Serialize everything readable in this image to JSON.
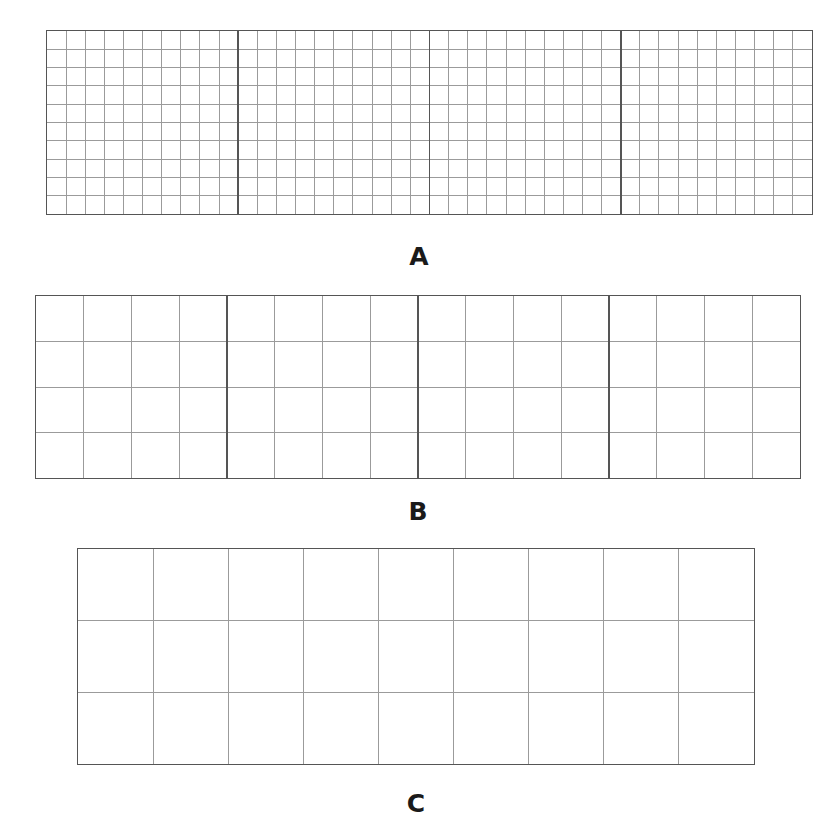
{
  "figure": {
    "panels": [
      {
        "label": "A",
        "blocks": 4,
        "cols_per_block": 10,
        "rows": 10,
        "description": "4 large squares each subdivided into a 10x10 grid"
      },
      {
        "label": "B",
        "blocks": 4,
        "cols_per_block": 4,
        "rows": 4,
        "description": "4 large squares each subdivided into a 4x4 grid"
      },
      {
        "label": "C",
        "blocks": 1,
        "cols_per_block": 9,
        "rows": 3,
        "description": "single rectangle divided into 9 columns and 3 rows"
      }
    ],
    "colors": {
      "minor_line": "#9a9a9a",
      "major_line": "#555555",
      "label": "#1a1a1a"
    }
  }
}
